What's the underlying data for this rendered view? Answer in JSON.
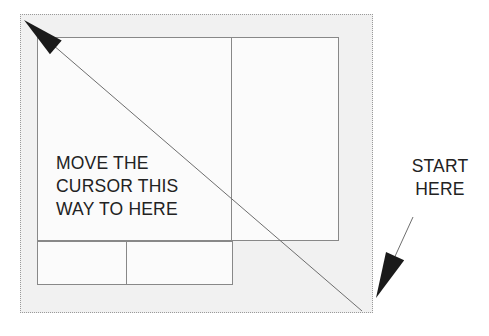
{
  "image": {
    "width": 489,
    "height": 336,
    "background_color": "#ffffff",
    "canvas_fill_color": "#f1f1f1",
    "canvas_border_style": "dotted",
    "canvas_border_color": "#9a9a9a",
    "rect_stroke_color": "#888888",
    "rect_fill_color": "#fbfbfb",
    "arrow_color": "#1a1a1a",
    "line_color": "#6e6e6e",
    "text_color": "#222222"
  },
  "annotations": {
    "instruction": {
      "lines": [
        "MOVE THE",
        "CURSOR THIS",
        "WAY TO HERE"
      ],
      "text": "MOVE THE\nCURSOR THIS\nWAY TO HERE"
    },
    "start": {
      "lines": [
        "START",
        "HERE"
      ],
      "text": "START\nHERE"
    }
  },
  "shapes": {
    "rectangles": [
      {
        "name": "main-outer-rectangle",
        "x": 36,
        "y": 36,
        "w": 302,
        "h": 204
      },
      {
        "name": "lower-left-rectangle",
        "x": 36,
        "y": 240,
        "w": 196,
        "h": 44
      }
    ],
    "dividers": [
      {
        "name": "upper-vertical-divider",
        "x": 230,
        "y1": 36,
        "y2": 240
      },
      {
        "name": "lower-vertical-divider",
        "x": 125,
        "y1": 240,
        "y2": 284
      }
    ],
    "drag_arrow": {
      "name": "drag-direction-arrow",
      "from": {
        "x": 362,
        "y": 311
      },
      "to": {
        "x": 24,
        "y": 20
      },
      "direction": "up-left"
    },
    "start_pointer": {
      "name": "start-here-pointer",
      "from": {
        "x": 413,
        "y": 217
      },
      "to": {
        "x": 376,
        "y": 298
      },
      "direction": "down-left"
    }
  }
}
